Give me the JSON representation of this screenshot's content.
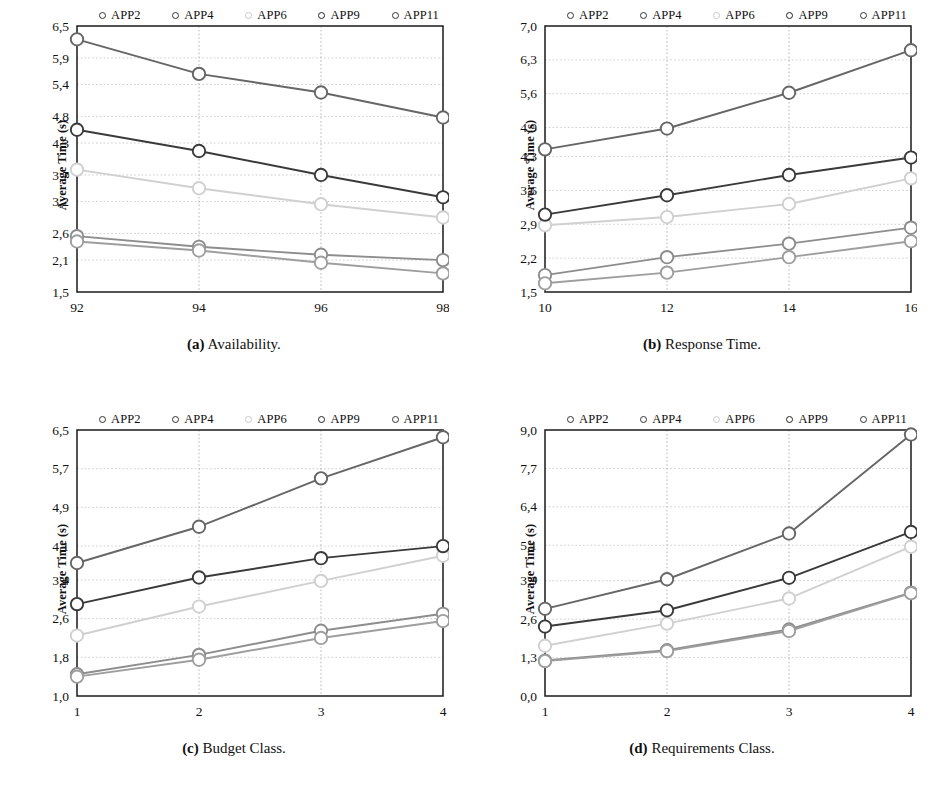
{
  "figure": {
    "series_names": [
      "APP2",
      "APP4",
      "APP6",
      "APP9",
      "APP11"
    ],
    "series_colors": [
      "#8d8d8d",
      "#9e9e9e",
      "#d0d0d0",
      "#3a3a3a",
      "#666666"
    ],
    "ylabel": "Average Time (s)"
  },
  "chart_data": [
    {
      "type": "line",
      "panel": "a",
      "caption_tag": "(a)",
      "caption_text": "Availability.",
      "title": "",
      "xlabel": "",
      "ylabel": "Average Time (s)",
      "x": [
        92,
        94,
        96,
        98
      ],
      "xticks": [
        "92",
        "94",
        "96",
        "98"
      ],
      "yticks": [
        1.5,
        2.1,
        2.6,
        3.2,
        3.7,
        4.3,
        4.8,
        5.4,
        5.9,
        6.5
      ],
      "ytick_labels": [
        "1,5",
        "2,1",
        "2,6",
        "3,2",
        "3,7",
        "4,3",
        "4,8",
        "5,4",
        "5,9",
        "6,5"
      ],
      "ylim": [
        1.5,
        6.5
      ],
      "xlim": [
        92,
        98
      ],
      "grid": true,
      "legend_position": "top",
      "series": [
        {
          "name": "APP2",
          "values": [
            2.55,
            2.35,
            2.2,
            2.1
          ]
        },
        {
          "name": "APP4",
          "values": [
            2.45,
            2.28,
            2.05,
            1.85
          ]
        },
        {
          "name": "APP6",
          "values": [
            3.8,
            3.45,
            3.15,
            2.9
          ]
        },
        {
          "name": "APP9",
          "values": [
            4.55,
            4.15,
            3.7,
            3.28
          ]
        },
        {
          "name": "APP11",
          "values": [
            6.25,
            5.6,
            5.25,
            4.78
          ]
        }
      ]
    },
    {
      "type": "line",
      "panel": "b",
      "caption_tag": "(b)",
      "caption_text": "Response Time.",
      "title": "",
      "xlabel": "",
      "ylabel": "Average Time (s)",
      "x": [
        10,
        12,
        14,
        16
      ],
      "xticks": [
        "10",
        "12",
        "14",
        "16"
      ],
      "yticks": [
        1.5,
        2.2,
        2.9,
        3.6,
        4.3,
        4.9,
        5.6,
        6.3,
        7.0
      ],
      "ytick_labels": [
        "1,5",
        "2,2",
        "2,9",
        "3,6",
        "4,3",
        "4,9",
        "5,6",
        "6,3",
        "7,0"
      ],
      "ylim": [
        1.5,
        7.0
      ],
      "xlim": [
        10,
        16
      ],
      "grid": true,
      "legend_position": "top",
      "series": [
        {
          "name": "APP2",
          "values": [
            1.85,
            2.22,
            2.5,
            2.83
          ]
        },
        {
          "name": "APP4",
          "values": [
            1.68,
            1.9,
            2.22,
            2.55
          ]
        },
        {
          "name": "APP6",
          "values": [
            2.88,
            3.05,
            3.32,
            3.85
          ]
        },
        {
          "name": "APP9",
          "values": [
            3.1,
            3.5,
            3.92,
            4.28
          ]
        },
        {
          "name": "APP11",
          "values": [
            4.45,
            4.88,
            5.62,
            6.5
          ]
        }
      ]
    },
    {
      "type": "line",
      "panel": "c",
      "caption_tag": "(c)",
      "caption_text": "Budget Class.",
      "title": "",
      "xlabel": "",
      "ylabel": "Average Time (s)",
      "x": [
        1,
        2,
        3,
        4
      ],
      "xticks": [
        "1",
        "2",
        "3",
        "4"
      ],
      "yticks": [
        1.0,
        1.8,
        2.6,
        3.4,
        4.1,
        4.9,
        5.7,
        6.5
      ],
      "ytick_labels": [
        "1,0",
        "1,8",
        "2,6",
        "3,4",
        "4,1",
        "4,9",
        "5,7",
        "6,5"
      ],
      "ylim": [
        1.0,
        6.5
      ],
      "xlim": [
        1,
        4
      ],
      "grid": true,
      "legend_position": "top",
      "series": [
        {
          "name": "APP2",
          "values": [
            1.45,
            1.85,
            2.35,
            2.7
          ]
        },
        {
          "name": "APP4",
          "values": [
            1.4,
            1.75,
            2.2,
            2.55
          ]
        },
        {
          "name": "APP6",
          "values": [
            2.25,
            2.85,
            3.38,
            3.9
          ]
        },
        {
          "name": "APP9",
          "values": [
            2.9,
            3.45,
            3.85,
            4.1
          ]
        },
        {
          "name": "APP11",
          "values": [
            3.75,
            4.5,
            5.5,
            6.35
          ]
        }
      ]
    },
    {
      "type": "line",
      "panel": "d",
      "caption_tag": "(d)",
      "caption_text": "Requirements Class.",
      "title": "",
      "xlabel": "",
      "ylabel": "Average Time (s)",
      "x": [
        1,
        2,
        3,
        4
      ],
      "xticks": [
        "1",
        "2",
        "3",
        "4"
      ],
      "yticks": [
        0.0,
        1.3,
        2.6,
        3.9,
        5.1,
        6.4,
        7.7,
        9.0
      ],
      "ytick_labels": [
        "0,0",
        "1,3",
        "2,6",
        "3,9",
        "5,1",
        "6,4",
        "7,7",
        "9,0"
      ],
      "ylim": [
        0.0,
        9.0
      ],
      "xlim": [
        1,
        4
      ],
      "grid": true,
      "legend_position": "top",
      "series": [
        {
          "name": "APP2",
          "values": [
            1.2,
            1.55,
            2.25,
            3.5
          ]
        },
        {
          "name": "APP4",
          "values": [
            1.18,
            1.52,
            2.2,
            3.48
          ]
        },
        {
          "name": "APP6",
          "values": [
            1.7,
            2.45,
            3.3,
            5.05
          ]
        },
        {
          "name": "APP9",
          "values": [
            2.35,
            2.9,
            4.0,
            5.55
          ]
        },
        {
          "name": "APP11",
          "values": [
            2.95,
            3.95,
            5.5,
            8.85
          ]
        }
      ]
    }
  ]
}
